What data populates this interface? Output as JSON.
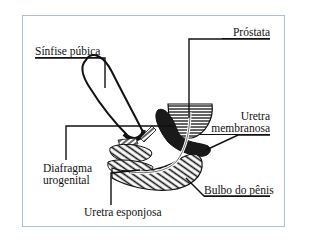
{
  "diagram": {
    "type": "anatomical-illustration",
    "labels": {
      "sinfise_pubica": "Sínfise púbica",
      "prostata": "Próstata",
      "uretra_membranosa_line1": "Uretra",
      "uretra_membranosa_line2": "membranosa",
      "diafragma_line1": "Diafragma",
      "diafragma_line2": "urogenital",
      "uretra_esponjosa": "Uretra esponjosa",
      "bulbo_do_penis": "Bulbo do pênis"
    },
    "colors": {
      "ink": "#111111",
      "frame_border": "#aebfd1",
      "background": "#ffffff"
    }
  }
}
